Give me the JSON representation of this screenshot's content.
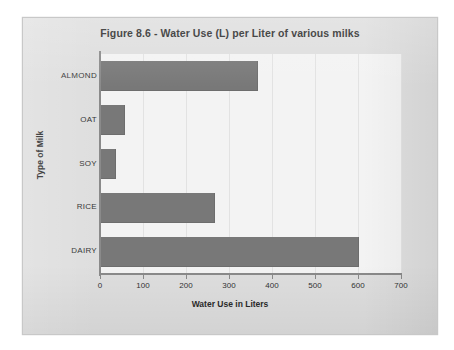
{
  "chart_data": {
    "type": "bar",
    "orientation": "horizontal",
    "title": "Figure 8.6 - Water Use (L) per Liter of various milks",
    "xlabel": "Water Use in Liters",
    "ylabel": "Type of Milk",
    "categories": [
      "ALMOND",
      "OAT",
      "SOY",
      "RICE",
      "DAIRY"
    ],
    "values": [
      364,
      56,
      35,
      266,
      600
    ],
    "xlim": [
      0,
      700
    ],
    "xticks": [
      0,
      100,
      200,
      300,
      400,
      500,
      600,
      700
    ],
    "xtick_labels": [
      "0",
      "100",
      "200",
      "300",
      "400",
      "500",
      "600",
      "700"
    ],
    "grid": true,
    "grid_axis": "x",
    "legend": false,
    "series": [
      {
        "name": "Water Use in Liters",
        "values": [
          364,
          56,
          35,
          266,
          600
        ]
      }
    ]
  },
  "colors": {
    "bar": "#787878",
    "plot_background": "#f3f3f3",
    "card_background": "#dedede",
    "gridline": "#e2e2e2",
    "axis": "#8a8a8a",
    "text": "#2b2b2b"
  }
}
